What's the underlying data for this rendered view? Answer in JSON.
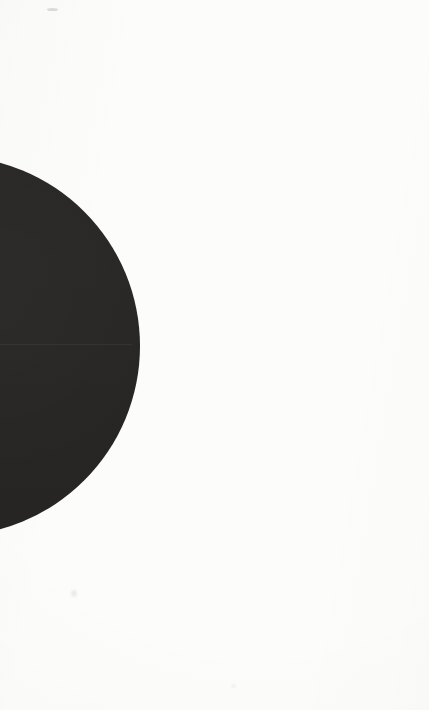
{
  "page": {
    "width": 429,
    "height": 710,
    "background_color": "#fcfcfb",
    "alt_text": ""
  },
  "artwork": {
    "name": "dark-circle",
    "shape": "circle",
    "description": "Large solid dark disc cropped by the left edge of the page",
    "fill_color": "#282624",
    "center_x": -50,
    "center_y": 346,
    "radius": 190,
    "visible_top_y": 197,
    "visible_bottom_y": 496,
    "rightmost_x": 140
  },
  "artifacts": {
    "scan_seam": {
      "name": "scan-seam",
      "y": 344,
      "x": 0,
      "width": 132,
      "color": "rgba(255,255,255,0.055)"
    },
    "marks": [
      {
        "name": "smudge-top",
        "x": 47,
        "y": 8,
        "width": 11,
        "height": 3
      },
      {
        "name": "smudge-middle",
        "x": 71,
        "y": 590,
        "width": 6,
        "height": 7
      },
      {
        "name": "smudge-lower",
        "x": 231,
        "y": 684,
        "width": 5,
        "height": 4
      }
    ]
  }
}
